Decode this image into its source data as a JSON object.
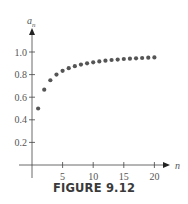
{
  "caption": "FIGURE 9.12",
  "chart_data": {
    "type": "scatter",
    "title": "",
    "xlabel": "n",
    "ylabel": "a_n",
    "ylabel_main": "a",
    "ylabel_sub": "n",
    "xlim": [
      0,
      21.5
    ],
    "ylim": [
      0,
      1.1
    ],
    "xticks": [
      5,
      10,
      15,
      20
    ],
    "xtick_labels": [
      "5",
      "10",
      "15",
      "20"
    ],
    "yticks": [
      0.2,
      0.4,
      0.6,
      0.8,
      1.0
    ],
    "ytick_labels": [
      "0.2",
      "0.4",
      "0.6",
      "0.8",
      "1.0"
    ],
    "grid": false,
    "legend": "none",
    "point_color": "#555555",
    "axis_color": "#444444",
    "x": [
      1,
      2,
      3,
      4,
      5,
      6,
      7,
      8,
      9,
      10,
      11,
      12,
      13,
      14,
      15,
      16,
      17,
      18,
      19,
      20
    ],
    "y": [
      0.5,
      0.667,
      0.75,
      0.8,
      0.833,
      0.857,
      0.875,
      0.889,
      0.9,
      0.909,
      0.917,
      0.923,
      0.929,
      0.933,
      0.938,
      0.941,
      0.944,
      0.947,
      0.95,
      0.952
    ]
  }
}
